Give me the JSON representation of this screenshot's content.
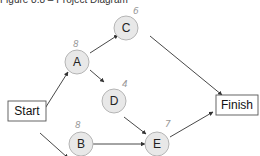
{
  "title": "Figure 8.8 – Project Diagram",
  "nodes": {
    "start": {
      "label": "Start"
    },
    "finish": {
      "label": "Finish"
    },
    "A": {
      "label": "A",
      "annotation": "8"
    },
    "B": {
      "label": "B",
      "annotation": "8"
    },
    "C": {
      "label": "C",
      "annotation": "6"
    },
    "D": {
      "label": "D",
      "annotation": "4"
    },
    "E": {
      "label": "E",
      "annotation": "7"
    }
  },
  "edges": [
    [
      "Start",
      "A"
    ],
    [
      "Start",
      "B"
    ],
    [
      "A",
      "C"
    ],
    [
      "A",
      "D"
    ],
    [
      "C",
      "Finish"
    ],
    [
      "D",
      "E"
    ],
    [
      "B",
      "E"
    ],
    [
      "E",
      "Finish"
    ]
  ],
  "colors": {
    "node_fill": "#e8e8e8",
    "node_stroke": "#b0b0b0",
    "edge": "#333333",
    "box_stroke": "#555555"
  }
}
